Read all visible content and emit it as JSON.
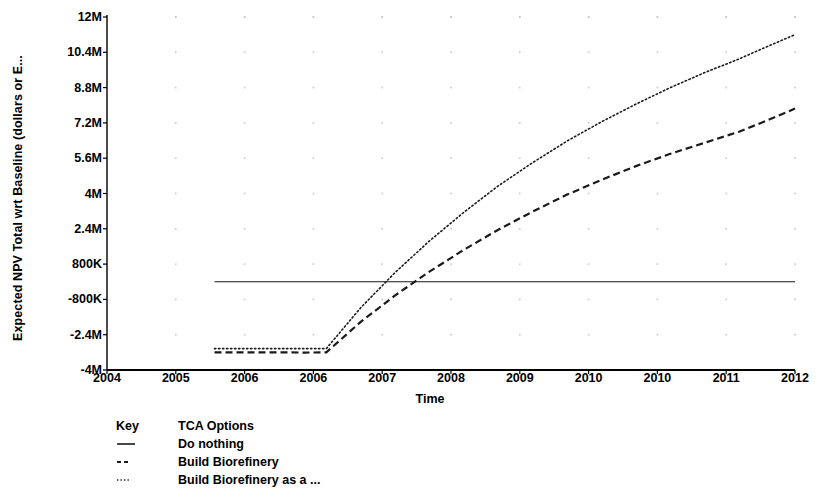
{
  "chart_data": {
    "type": "line",
    "title": "",
    "xlabel": "Time",
    "ylabel": "Expected NPV Total wrt Baseline (dollars or E...",
    "x_tick_labels": [
      "2004",
      "2005",
      "2006",
      "2006",
      "2007",
      "2008",
      "2009",
      "2010",
      "2010",
      "2011",
      "2012"
    ],
    "y_tick_labels": [
      "12M",
      "10.4M",
      "8.8M",
      "7.2M",
      "5.6M",
      "4M",
      "2.4M",
      "800K",
      "-800K",
      "-2.4M",
      "-4M"
    ],
    "y_tick_values": [
      12000000,
      10400000,
      8800000,
      7200000,
      5600000,
      4000000,
      2400000,
      800000,
      -800000,
      -2400000,
      -4000000
    ],
    "ylim": [
      -4000000,
      12000000
    ],
    "xlim": [
      2004.0,
      2012.0
    ],
    "grid": "dots",
    "legend_position": "below-left",
    "series": [
      {
        "name": "Do nothing",
        "style": "solid",
        "x": [
          2005.25,
          2012.0
        ],
        "values": [
          0,
          0
        ]
      },
      {
        "name": "Build Biorefinery",
        "style": "dashed",
        "x": [
          2005.25,
          2005.6,
          2005.95,
          2006.3,
          2006.55,
          2006.95,
          2007.35,
          2007.75,
          2008.15,
          2008.55,
          2008.95,
          2009.35,
          2009.75,
          2010.15,
          2010.55,
          2010.95,
          2011.35,
          2011.7,
          2012.0
        ],
        "values": [
          -3200000,
          -3200000,
          -3200000,
          -3210000,
          -3200000,
          -1820000,
          -620000,
          460000,
          1450000,
          2360000,
          3180000,
          3950000,
          4620000,
          5240000,
          5800000,
          6300000,
          6800000,
          7350000,
          7850000
        ]
      },
      {
        "name": "Build Biorefinery as a ...",
        "style": "dotted",
        "x": [
          2005.25,
          2005.6,
          2005.95,
          2006.3,
          2006.55,
          2006.95,
          2007.35,
          2007.75,
          2008.15,
          2008.55,
          2008.95,
          2009.35,
          2009.75,
          2010.15,
          2010.55,
          2010.95,
          2011.35,
          2011.7,
          2012.0
        ],
        "values": [
          -3030000,
          -3030000,
          -3030000,
          -3030000,
          -3030000,
          -1180000,
          420000,
          1850000,
          3150000,
          4350000,
          5400000,
          6380000,
          7250000,
          8050000,
          8800000,
          9480000,
          10100000,
          10700000,
          11200000
        ]
      }
    ]
  },
  "legend": {
    "header_key": "Key",
    "header_title": "TCA Options",
    "entries": [
      {
        "label": "Do nothing",
        "style": "solid"
      },
      {
        "label": "Build Biorefinery",
        "style": "dashed"
      },
      {
        "label": "Build Biorefinery as a ...",
        "style": "dotted"
      }
    ]
  },
  "colors": {
    "axis": "#000000",
    "line": "#1a1a1a",
    "grid_dot": "#c8c8c8",
    "background": "#ffffff"
  }
}
